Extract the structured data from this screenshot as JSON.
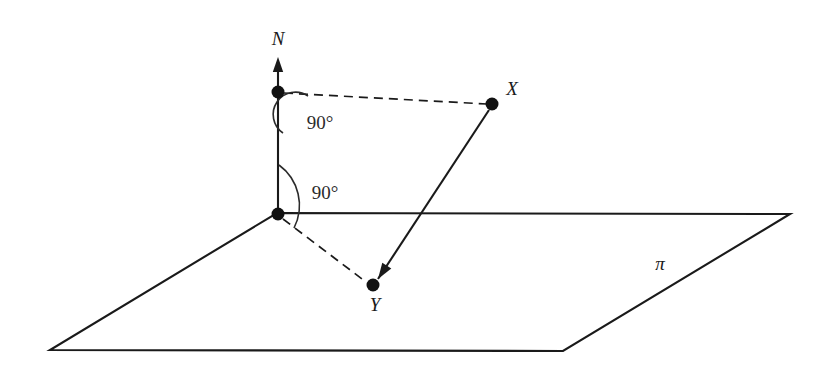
{
  "figure": {
    "kind": "3d-geometry-diagram",
    "stroke_color": "#1a1a1a",
    "background_color": "#ffffff",
    "width": 834,
    "height": 377
  },
  "labels": {
    "normal": "N",
    "point_x": "X",
    "point_y": "Y",
    "plane": "π",
    "angle_upper": "90°",
    "angle_lower": "90°"
  },
  "geometry": {
    "plane_polygon": "277,213 790,214 563,351 50,350",
    "normal_line": {
      "x1": 278,
      "y1": 214,
      "x2": 278,
      "y2": 62
    },
    "arrow_tip": {
      "x": 278,
      "y": 57
    },
    "points": {
      "foot": {
        "x": 278,
        "y": 214,
        "r": 6.5
      },
      "upper": {
        "x": 278,
        "y": 92,
        "r": 6.5
      },
      "x": {
        "x": 492,
        "y": 104,
        "r": 6.5
      },
      "y": {
        "x": 373,
        "y": 285,
        "r": 6.5
      }
    },
    "dashed_upper_to_x": {
      "x1": 284,
      "y1": 93,
      "x2": 487,
      "y2": 104
    },
    "dashed_foot_to_y": {
      "x1": 283,
      "y1": 219,
      "x2": 366,
      "y2": 282
    },
    "solid_x_to_y": {
      "x1": 489,
      "y1": 110,
      "x2": 378,
      "y2": 279
    },
    "arc_upper": "M 308,96 A 22,22 0 0 0 283,133",
    "arc_lower": "M 279,165 A 50,50 0 0 1 294,228"
  },
  "label_positions": {
    "normal": {
      "x": 278,
      "y": 38
    },
    "point_x": {
      "x": 512,
      "y": 88
    },
    "point_y": {
      "x": 375,
      "y": 304
    },
    "plane": {
      "x": 660,
      "y": 263
    },
    "angle_upper": {
      "x": 320,
      "y": 122
    },
    "angle_lower": {
      "x": 325,
      "y": 192
    }
  }
}
